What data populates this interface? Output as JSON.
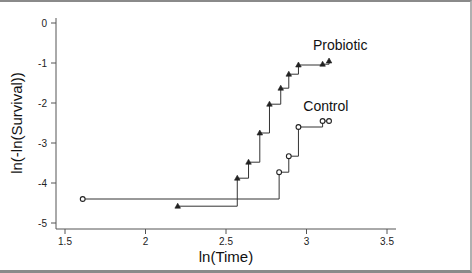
{
  "chart_data": {
    "type": "line",
    "subtype": "step",
    "title": "",
    "xlabel": "ln(Time)",
    "ylabel": "ln(-ln(Survival))",
    "xlim": [
      1.45,
      3.55
    ],
    "ylim": [
      -5.15,
      0.1
    ],
    "x_ticks": [
      1.5,
      2,
      2.5,
      3,
      3.5
    ],
    "x_tick_labels": [
      "1.5",
      "2",
      "2.5",
      "3",
      "3.5"
    ],
    "y_ticks": [
      0,
      -1,
      -2,
      -3,
      -4,
      -5
    ],
    "y_tick_labels": [
      "0",
      "-1",
      "-2",
      "-3",
      "-4",
      "-5"
    ],
    "grid": false,
    "legend": "inline labels",
    "series": [
      {
        "name": "Probiotic",
        "marker": "triangle",
        "label_pos": [
          3.04,
          -0.68
        ],
        "points": [
          {
            "x": 2.2,
            "y": -4.58
          },
          {
            "x": 2.57,
            "y": -3.88
          },
          {
            "x": 2.64,
            "y": -3.48
          },
          {
            "x": 2.71,
            "y": -2.75
          },
          {
            "x": 2.77,
            "y": -2.03
          },
          {
            "x": 2.84,
            "y": -1.63
          },
          {
            "x": 2.89,
            "y": -1.28
          },
          {
            "x": 2.95,
            "y": -1.05
          },
          {
            "x": 3.1,
            "y": -1.03
          },
          {
            "x": 3.14,
            "y": -0.95
          }
        ]
      },
      {
        "name": "Control",
        "marker": "circle",
        "label_pos": [
          2.98,
          -2.2
        ],
        "points": [
          {
            "x": 1.61,
            "y": -4.4
          },
          {
            "x": 2.83,
            "y": -3.73
          },
          {
            "x": 2.89,
            "y": -3.33
          },
          {
            "x": 2.95,
            "y": -2.6
          },
          {
            "x": 3.1,
            "y": -2.45
          },
          {
            "x": 3.14,
            "y": -2.45
          }
        ]
      }
    ]
  },
  "colors": {
    "line": "#333333",
    "axis": "#555555",
    "frame": "#8a8a8a"
  }
}
